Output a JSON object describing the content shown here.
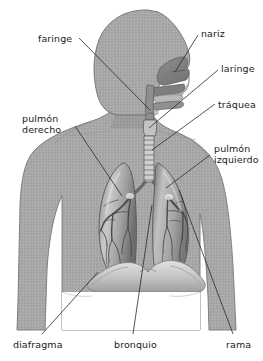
{
  "figure": {
    "language": "es",
    "width": 263,
    "height": 361,
    "background_color": "#ffffff"
  },
  "colors": {
    "body_fill": "#a9a9a9",
    "body_fill_dark": "#8f8f8f",
    "body_outline": "#6f6f6f",
    "lung_light": "#d7d7d7",
    "lung_mid": "#9a9a9a",
    "lung_dark": "#5d5d5d",
    "cavity_fill": "#8a8a8a",
    "trachea_light": "#ececec",
    "diaphragm": "#c4c4c4",
    "leader_line": "#2a2a2a",
    "label_text": "#1b1b1b"
  },
  "labels": [
    {
      "id": "faringe",
      "text": "faringe",
      "text2": "",
      "x": 38,
      "y": 33,
      "align": "left"
    },
    {
      "id": "nariz",
      "text": "nariz",
      "text2": "",
      "x": 201,
      "y": 28,
      "align": "left"
    },
    {
      "id": "laringe",
      "text": "laringe",
      "text2": "",
      "x": 221,
      "y": 63,
      "align": "left"
    },
    {
      "id": "traquea",
      "text": "tráquea",
      "text2": "",
      "x": 218,
      "y": 99,
      "align": "left"
    },
    {
      "id": "pulmon-derecho",
      "text": "pulmón",
      "text2": "derecho",
      "x": 22,
      "y": 113,
      "align": "left"
    },
    {
      "id": "pulmon-izquierdo",
      "text": "pulmón",
      "text2": "izquierdo",
      "x": 214,
      "y": 143,
      "align": "left"
    },
    {
      "id": "diafragma",
      "text": "diafragma",
      "text2": "",
      "x": 13,
      "y": 339,
      "align": "left"
    },
    {
      "id": "bronquio",
      "text": "bronquio",
      "text2": "",
      "x": 114,
      "y": 339,
      "align": "left"
    },
    {
      "id": "rama",
      "text": "rama",
      "text2": "",
      "x": 226,
      "y": 339,
      "align": "left"
    }
  ],
  "leader_lines": [
    {
      "id": "faringe-leader",
      "x1": 79,
      "y1": 38,
      "x2": 150,
      "y2": 110
    },
    {
      "id": "nariz-leader",
      "x1": 198,
      "y1": 35,
      "x2": 175,
      "y2": 72
    },
    {
      "id": "laringe-leader",
      "x1": 218,
      "y1": 70,
      "x2": 149,
      "y2": 128
    },
    {
      "id": "traquea-leader",
      "x1": 215,
      "y1": 104,
      "x2": 152,
      "y2": 150
    },
    {
      "id": "pulmon-derecho-leader",
      "x1": 75,
      "y1": 126,
      "x2": 122,
      "y2": 196
    },
    {
      "id": "pulmon-izquierdo-leader",
      "x1": 210,
      "y1": 155,
      "x2": 166,
      "y2": 188
    },
    {
      "id": "diafragma-leader",
      "x1": 42,
      "y1": 334,
      "x2": 98,
      "y2": 272
    },
    {
      "id": "bronquio-leader",
      "x1": 133,
      "y1": 334,
      "x2": 152,
      "y2": 205
    },
    {
      "id": "rama-leader",
      "x1": 233,
      "y1": 334,
      "x2": 179,
      "y2": 190
    }
  ],
  "structures": [
    {
      "id": "head",
      "name": "cabeza"
    },
    {
      "id": "nasal-cavity",
      "name": "cavidad nasal"
    },
    {
      "id": "oral-cavity",
      "name": "cavidad oral"
    },
    {
      "id": "pharynx",
      "name": "faringe"
    },
    {
      "id": "larynx",
      "name": "laringe"
    },
    {
      "id": "trachea",
      "name": "tráquea"
    },
    {
      "id": "right-lung",
      "name": "pulmón derecho"
    },
    {
      "id": "left-lung",
      "name": "pulmón izquierdo"
    },
    {
      "id": "bronchial-tree",
      "name": "árbol bronquial"
    },
    {
      "id": "diaphragm",
      "name": "diafragma"
    },
    {
      "id": "torso",
      "name": "torso"
    }
  ]
}
